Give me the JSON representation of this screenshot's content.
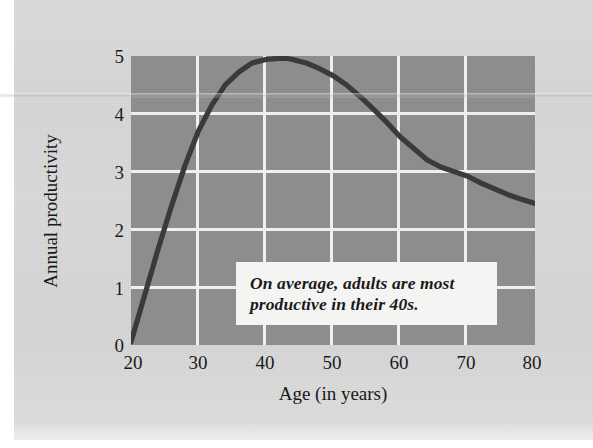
{
  "figure": {
    "annotation_lines": [
      "On average, adults are most",
      "productive in their 40s."
    ],
    "paper_color": "#d8d8d8",
    "plot_bg_color": "#8d8d8d",
    "gridline_color": "#efefef",
    "curve_color": "#3a3a3a",
    "annotation_bg_color": "#f4f4f2"
  },
  "chart_data": {
    "type": "line",
    "title": "",
    "xlabel": "Age (in years)",
    "ylabel": "Annual productivity",
    "xlim": [
      20,
      80
    ],
    "ylim": [
      0,
      5
    ],
    "xticks": [
      "20",
      "30",
      "40",
      "50",
      "60",
      "70",
      "80"
    ],
    "yticks": [
      "0",
      "1",
      "2",
      "3",
      "4",
      "5"
    ],
    "grid": true,
    "legend": "none",
    "annotations": [
      {
        "text": "On average, adults are most productive in their 40s.",
        "x_range": [
          27,
          65
        ],
        "y_range": [
          0.6,
          1.65
        ]
      }
    ],
    "series": [
      {
        "name": "Annual productivity",
        "x": [
          20,
          22,
          24,
          26,
          28,
          30,
          32,
          34,
          36,
          38,
          40,
          42,
          43,
          44,
          46,
          48,
          50,
          52,
          54,
          56,
          58,
          60,
          62,
          64,
          66,
          68,
          70,
          72,
          74,
          76,
          78,
          80
        ],
        "y": [
          0.05,
          0.85,
          1.65,
          2.4,
          3.1,
          3.7,
          4.15,
          4.5,
          4.72,
          4.88,
          4.94,
          4.96,
          4.96,
          4.94,
          4.88,
          4.78,
          4.66,
          4.5,
          4.3,
          4.08,
          3.85,
          3.6,
          3.4,
          3.2,
          3.08,
          3.0,
          2.92,
          2.8,
          2.7,
          2.6,
          2.52,
          2.45
        ]
      }
    ]
  }
}
